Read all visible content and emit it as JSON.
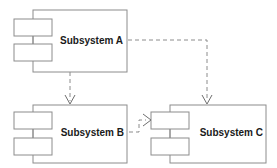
{
  "diagram": {
    "type": "uml-component-diagram",
    "title": "",
    "canvas": {
      "width": 277,
      "height": 168
    },
    "colors": {
      "background": "#ffffff",
      "stroke": "#8c8c8c",
      "arrow": "#6e6e6e",
      "text": "#1a1a1a",
      "fill": "#ffffff"
    },
    "components": [
      {
        "id": "subsystem-a",
        "label": "Subsystem A",
        "box": {
          "x": 33,
          "y": 10,
          "width": 94,
          "height": 62
        },
        "label_anchor": {
          "x": 123,
          "y": 40
        },
        "tabs": [
          {
            "x": 14,
            "y": 19,
            "width": 38,
            "height": 17
          },
          {
            "x": 14,
            "y": 44,
            "width": 38,
            "height": 17
          }
        ]
      },
      {
        "id": "subsystem-b",
        "label": "Subsystem B",
        "box": {
          "x": 33,
          "y": 105,
          "width": 94,
          "height": 58
        },
        "label_anchor": {
          "x": 124,
          "y": 132
        },
        "tabs": [
          {
            "x": 14,
            "y": 112,
            "width": 38,
            "height": 17
          },
          {
            "x": 14,
            "y": 138,
            "width": 38,
            "height": 17
          }
        ]
      },
      {
        "id": "subsystem-c",
        "label": "Subsystem C",
        "box": {
          "x": 170,
          "y": 105,
          "width": 96,
          "height": 58
        },
        "label_anchor": {
          "x": 263,
          "y": 132
        },
        "tabs": [
          {
            "x": 151,
            "y": 112,
            "width": 38,
            "height": 17
          },
          {
            "x": 151,
            "y": 138,
            "width": 38,
            "height": 17
          }
        ]
      }
    ],
    "dependencies": [
      {
        "id": "dep-a-to-b",
        "from": "subsystem-a",
        "to": "subsystem-b",
        "style": "dashed",
        "arrow": "open",
        "path": "M 70 72 L 70 103",
        "head": "M 65 96 L 70 104 L 75 96"
      },
      {
        "id": "dep-a-to-c",
        "from": "subsystem-a",
        "to": "subsystem-c",
        "style": "dashed",
        "arrow": "open",
        "path": "M 128 40 L 207 40 L 207 103",
        "head": "M 202 96 L 207 104 L 212 96"
      },
      {
        "id": "dep-b-to-c",
        "from": "subsystem-b",
        "to": "subsystem-c",
        "style": "dashed",
        "arrow": "open",
        "path": "M 129 132 L 139 132 L 139 120 L 148 120",
        "head": "M 143 115 L 150 120 L 143 125"
      }
    ]
  }
}
